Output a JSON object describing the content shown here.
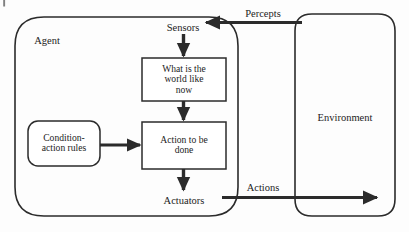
{
  "figure": {
    "kind": "block-diagram",
    "background_color": "#fdfdfd",
    "line_color": "#2b2b2b",
    "text_color": "#1c1c1c"
  },
  "containers": {
    "agent": {
      "label": "Agent",
      "shape": "rounded-rectangle",
      "label_x": 47,
      "label_y": 41,
      "font_size": 10.5
    },
    "environment": {
      "label": "Environment",
      "shape": "rounded-rectangle",
      "label_x": 345,
      "label_y": 118,
      "font_size": 10.5
    }
  },
  "ports": {
    "sensors": {
      "label": "Sensors",
      "x": 183,
      "y": 28,
      "font_size": 10.5
    },
    "actuators": {
      "label": "Actuators",
      "x": 184,
      "y": 201,
      "font_size": 10.5
    }
  },
  "boxes": [
    {
      "id": "world-state",
      "label": "What is the world like now",
      "lines": [
        "What is the",
        "world like",
        "now"
      ],
      "shape": "rectangle",
      "x": 142,
      "y": 58,
      "w": 84,
      "h": 43,
      "font_size": 9.6
    },
    {
      "id": "action-to-do",
      "label": "Action to be done",
      "lines": [
        "Action to be",
        "done"
      ],
      "shape": "rectangle",
      "x": 142,
      "y": 122,
      "w": 84,
      "h": 47,
      "font_size": 9.6
    },
    {
      "id": "condition-action-rules",
      "label": "Condition-action rules",
      "lines": [
        "Condition-",
        "action rules"
      ],
      "shape": "rounded-rectangle",
      "x": 28,
      "y": 121,
      "w": 72,
      "h": 45,
      "font_size": 9.6
    }
  ],
  "flows": [
    {
      "id": "percepts",
      "label": "Percepts",
      "label_x": 263,
      "label_y": 14,
      "direction": "right-to-left",
      "from": "environment",
      "to": "sensors",
      "font_size": 10.5
    },
    {
      "id": "actions",
      "label": "Actions",
      "label_x": 263,
      "label_y": 188,
      "direction": "left-to-right",
      "from": "actuators",
      "to": "environment",
      "font_size": 10.5
    },
    {
      "id": "sensors-to-world-state",
      "label": "",
      "direction": "downward",
      "from": "sensors",
      "to": "world-state"
    },
    {
      "id": "world-state-to-action",
      "label": "",
      "direction": "downward",
      "from": "world-state",
      "to": "action-to-do"
    },
    {
      "id": "action-to-actuators",
      "label": "",
      "direction": "downward",
      "from": "action-to-do",
      "to": "actuators"
    },
    {
      "id": "rules-to-action",
      "label": "",
      "direction": "left-to-right",
      "from": "condition-action-rules",
      "to": "action-to-do"
    }
  ]
}
